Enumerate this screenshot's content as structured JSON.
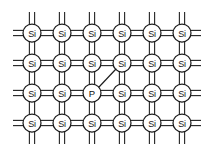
{
  "figure": {
    "background_color": "#ffffff",
    "line_color": "#1c1c1c",
    "width": 211,
    "height": 151
  },
  "lattice": {
    "rows": 4,
    "columns": 6,
    "column_centers_px": [
      32,
      62,
      92,
      122,
      152,
      182
    ],
    "row_centers_px": [
      33,
      63,
      93,
      123
    ],
    "atom_radius_px": 9,
    "bond_type": "double-line covalent bond",
    "bond_gap_px": 2.6,
    "edge_stub_length_px": 10,
    "atoms": [
      [
        {
          "symbol": "Si",
          "name": "silicon"
        },
        {
          "symbol": "Si",
          "name": "silicon"
        },
        {
          "symbol": "Si",
          "name": "silicon"
        },
        {
          "symbol": "Si",
          "name": "silicon"
        },
        {
          "symbol": "Si",
          "name": "silicon"
        },
        {
          "symbol": "Si",
          "name": "silicon"
        }
      ],
      [
        {
          "symbol": "Si",
          "name": "silicon"
        },
        {
          "symbol": "Si",
          "name": "silicon"
        },
        {
          "symbol": "Si",
          "name": "silicon"
        },
        {
          "symbol": "Si",
          "name": "silicon"
        },
        {
          "symbol": "Si",
          "name": "silicon"
        },
        {
          "symbol": "Si",
          "name": "silicon"
        }
      ],
      [
        {
          "symbol": "Si",
          "name": "silicon"
        },
        {
          "symbol": "Si",
          "name": "silicon"
        },
        {
          "symbol": "P",
          "name": "phosphorus"
        },
        {
          "symbol": "Si",
          "name": "silicon"
        },
        {
          "symbol": "Si",
          "name": "silicon"
        },
        {
          "symbol": "Si",
          "name": "silicon"
        }
      ],
      [
        {
          "symbol": "Si",
          "name": "silicon"
        },
        {
          "symbol": "Si",
          "name": "silicon"
        },
        {
          "symbol": "Si",
          "name": "silicon"
        },
        {
          "symbol": "Si",
          "name": "silicon"
        },
        {
          "symbol": "Si",
          "name": "silicon"
        },
        {
          "symbol": "Si",
          "name": "silicon"
        }
      ]
    ]
  },
  "dopant": {
    "symbol": "P",
    "name": "phosphorus",
    "row_index": 2,
    "column_index": 2,
    "center_px": [
      92,
      93
    ]
  },
  "pointer": {
    "name": "free-electron-pointer",
    "from_px": [
      99,
      87
    ],
    "to_px": [
      116,
      69
    ],
    "description": "diagonal leader line from the phosphorus atom"
  }
}
